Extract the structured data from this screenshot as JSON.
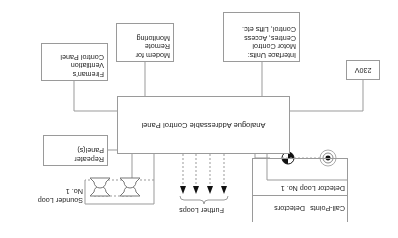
{
  "diagram": {
    "orientation": "rotated-180",
    "main_panel": {
      "label": "Analogue Addressable Control Panel"
    },
    "power": {
      "label": "230V"
    },
    "interface_units": {
      "lines": [
        "Interface Units:",
        "Motor Control",
        "Centres, Access",
        "Control, Lifts etc."
      ]
    },
    "modem": {
      "lines": [
        "Modem for",
        "Remote",
        "Monitoring"
      ]
    },
    "firemans_panel": {
      "lines": [
        "Fireman's",
        "Ventilation",
        "Control Panel"
      ]
    },
    "repeater": {
      "lines": [
        "Repeater",
        "Panel(s)"
      ]
    },
    "sounder_loop": {
      "lines": [
        "Sounder Loop",
        "No. 1"
      ],
      "icon": "sounder-icon",
      "count": 4
    },
    "further_loops": {
      "label": "Further Loops",
      "arrow_count": 4
    },
    "detector_loop": {
      "title": "Detector Loop No. 1",
      "devices": [
        {
          "label": "Detectors",
          "icon": "detector-icon"
        },
        {
          "label": "Call-Points",
          "icon": "call-point-icon"
        }
      ]
    }
  }
}
